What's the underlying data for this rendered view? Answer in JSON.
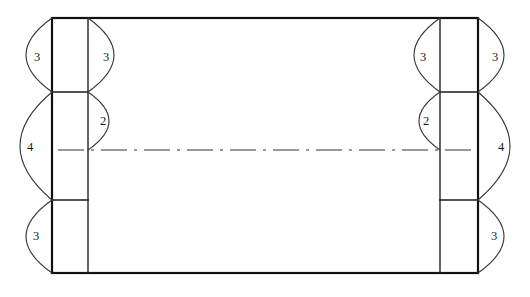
{
  "drawing": {
    "title": "Box blank layout with folded end panels",
    "type": "engineering-line-drawing",
    "canvas": {
      "width": 530,
      "height": 297
    },
    "colors": {
      "background": "#ffffff",
      "outline": "#111111",
      "inner_line": "#222222",
      "divider": "#1a1a1a",
      "centerline": "#333333",
      "arc": "#3a3a3a",
      "label_text": "#1a1a1a"
    },
    "outline": {
      "x1": 52,
      "y1": 18,
      "x2": 478,
      "y2": 273
    },
    "vertical_lines": [
      {
        "name": "left-inner-fold-line",
        "x": 88,
        "y1": 18,
        "y2": 273
      },
      {
        "name": "right-inner-fold-line",
        "x": 440,
        "y1": 18,
        "y2": 273
      }
    ],
    "horizontal_dividers": [
      {
        "name": "left-upper-divider",
        "x1": 52,
        "x2": 88,
        "y": 92
      },
      {
        "name": "left-lower-divider",
        "x1": 52,
        "x2": 88,
        "y": 200
      },
      {
        "name": "right-upper-divider",
        "x1": 440,
        "x2": 478,
        "y": 92
      },
      {
        "name": "right-lower-divider",
        "x1": 440,
        "x2": 478,
        "y": 200
      }
    ],
    "centerline": {
      "name": "horizontal-centerline",
      "x1": 58,
      "x2": 472,
      "y": 150
    },
    "dimension_arcs": [
      {
        "id": "left-outer-top",
        "label": "3",
        "anchor_x": 52,
        "y_start": 18,
        "y_end": 92,
        "bulge": "left",
        "bulge_amount": 26,
        "label_x": 37,
        "label_y": 58
      },
      {
        "id": "left-inner-top",
        "label": "3",
        "anchor_x": 88,
        "y_start": 18,
        "y_end": 92,
        "bulge": "right",
        "bulge_amount": 26,
        "label_x": 106,
        "label_y": 58
      },
      {
        "id": "left-inner-middle",
        "label": "2",
        "anchor_x": 88,
        "y_start": 92,
        "y_end": 150,
        "bulge": "right",
        "bulge_amount": 21,
        "label_x": 103,
        "label_y": 122
      },
      {
        "id": "left-outer-middle",
        "label": "4",
        "anchor_x": 52,
        "y_start": 92,
        "y_end": 200,
        "bulge": "left",
        "bulge_amount": 32,
        "label_x": 30,
        "label_y": 148
      },
      {
        "id": "left-outer-bottom",
        "label": "3",
        "anchor_x": 52,
        "y_start": 200,
        "y_end": 273,
        "bulge": "left",
        "bulge_amount": 26,
        "label_x": 36,
        "label_y": 237
      },
      {
        "id": "right-inner-top",
        "label": "3",
        "anchor_x": 440,
        "y_start": 18,
        "y_end": 92,
        "bulge": "left",
        "bulge_amount": 26,
        "label_x": 423,
        "label_y": 58
      },
      {
        "id": "right-outer-top",
        "label": "3",
        "anchor_x": 478,
        "y_start": 18,
        "y_end": 92,
        "bulge": "right",
        "bulge_amount": 26,
        "label_x": 495,
        "label_y": 58
      },
      {
        "id": "right-inner-middle",
        "label": "2",
        "anchor_x": 440,
        "y_start": 92,
        "y_end": 150,
        "bulge": "left",
        "bulge_amount": 21,
        "label_x": 426,
        "label_y": 122
      },
      {
        "id": "right-outer-middle",
        "label": "4",
        "anchor_x": 478,
        "y_start": 92,
        "y_end": 200,
        "bulge": "right",
        "bulge_amount": 32,
        "label_x": 501,
        "label_y": 148
      },
      {
        "id": "right-outer-bottom",
        "label": "3",
        "anchor_x": 478,
        "y_start": 200,
        "y_end": 273,
        "bulge": "right",
        "bulge_amount": 26,
        "label_x": 494,
        "label_y": 237
      }
    ]
  }
}
